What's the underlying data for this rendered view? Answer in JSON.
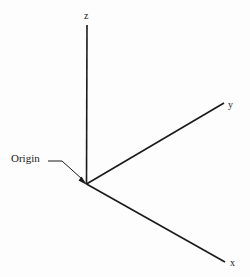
{
  "figure": {
    "type": "3d-coordinate-axes-diagram",
    "background_color": "#fdfdfd",
    "line_color": "#1a1a1a",
    "text_color": "#1a1a1a"
  },
  "axes": [
    {
      "id": "z",
      "label": "z",
      "description": "vertical axis pointing up from origin",
      "from": [
        86,
        184
      ],
      "to": [
        87,
        25
      ]
    },
    {
      "id": "y",
      "label": "y",
      "description": "axis pointing up and to the right from origin",
      "from": [
        86,
        184
      ],
      "to": [
        224,
        103
      ]
    },
    {
      "id": "x",
      "label": "x",
      "description": "axis pointing down and to the right from origin",
      "from": [
        86,
        184
      ],
      "to": [
        225,
        262
      ]
    }
  ],
  "annotation": {
    "label": "Origin",
    "leader_points": "48,161 62,161 84,181",
    "arrow_target": [
      86,
      184
    ]
  }
}
